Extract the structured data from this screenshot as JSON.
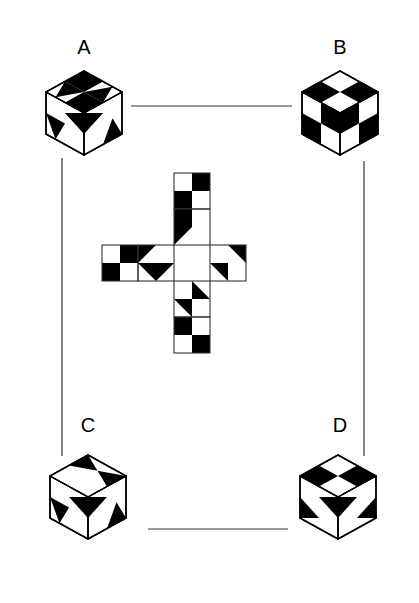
{
  "figure": {
    "title": "",
    "kind": "cube-net-matching-puzzle",
    "background_color": "#ffffff",
    "ink_color": "#000000",
    "line_color": "#333333"
  },
  "labels": {
    "a": "A",
    "b": "B",
    "c": "C",
    "d": "D"
  },
  "cubes": [
    {
      "id": "A",
      "label": "A",
      "label_x": 84,
      "label_y": 54,
      "center_x": 84,
      "center_y": 113,
      "faces": {
        "top": [
          "white-tri-black-right",
          "black",
          "black",
          "white-tri-black-left"
        ],
        "left": [
          "white",
          "black-tri-left",
          "black-tri-down",
          "white"
        ],
        "right": [
          "black-tri-right",
          "white",
          "white",
          "black-tri-up"
        ]
      }
    },
    {
      "id": "B",
      "label": "B",
      "label_x": 340,
      "label_y": 54,
      "center_x": 340,
      "center_y": 113,
      "faces": {
        "top": [
          "black",
          "white",
          "white",
          "black"
        ],
        "left": [
          "white",
          "black",
          "black",
          "white"
        ],
        "right": [
          "black",
          "white",
          "white",
          "black"
        ]
      }
    },
    {
      "id": "C",
      "label": "C",
      "label_x": 88,
      "label_y": 432,
      "center_x": 88,
      "center_y": 497,
      "faces": {
        "top": [
          "white",
          "black-tri-down",
          "white",
          "black-tri-up"
        ],
        "left": [
          "white",
          "black-tri-left",
          "black-tri-down",
          "white"
        ],
        "right": [
          "black-tri-right",
          "white",
          "white",
          "black-tri-up"
        ]
      }
    },
    {
      "id": "D",
      "label": "D",
      "label_x": 340,
      "label_y": 432,
      "center_x": 338,
      "center_y": 497,
      "faces": {
        "top": [
          "black",
          "white",
          "white",
          "black"
        ],
        "left": [
          "white",
          "black-tri-left",
          "black-tri-right",
          "white"
        ],
        "right": [
          "black-tri-right",
          "white",
          "white",
          "black-tri-left"
        ]
      }
    }
  ],
  "net": {
    "kind": "cross",
    "cell_size": 36,
    "origin_x": 102,
    "origin_y": 173,
    "squares": [
      {
        "name": "top",
        "col": 2,
        "row": 0,
        "quads": [
          "white",
          "black",
          "black",
          "white"
        ]
      },
      {
        "name": "upper-middle",
        "col": 2,
        "row": 1,
        "quads": [
          "black",
          "white",
          "tri-black-tl",
          "white"
        ]
      },
      {
        "name": "left",
        "col": 0,
        "row": 2,
        "quads": [
          "white",
          "black",
          "black",
          "white"
        ]
      },
      {
        "name": "center-left",
        "col": 1,
        "row": 2,
        "quads": [
          "tri-black-tl",
          "white",
          "tri-black-tr",
          "tri-black-tl"
        ]
      },
      {
        "name": "center-right",
        "col": 3,
        "row": 2,
        "quads": [
          "white",
          "tri-black-tr",
          "tri-black-tr",
          "white"
        ]
      },
      {
        "name": "lower-middle",
        "col": 2,
        "row": 3,
        "quads": [
          "white",
          "tri-black-bl",
          "tri-black-tr",
          "white"
        ]
      },
      {
        "name": "bottom",
        "col": 2,
        "row": 4,
        "quads": [
          "black",
          "white",
          "white",
          "black"
        ]
      }
    ]
  },
  "connectors": [
    {
      "name": "a-to-b",
      "from": "A",
      "to": "B",
      "orientation": "horizontal",
      "x1": 131,
      "y1": 106,
      "x2": 292,
      "y2": 106
    },
    {
      "name": "c-to-d",
      "from": "C",
      "to": "D",
      "orientation": "horizontal",
      "x1": 148,
      "y1": 529,
      "x2": 288,
      "y2": 529
    },
    {
      "name": "a-to-c",
      "from": "A",
      "to": "C",
      "orientation": "vertical",
      "x1": 62,
      "y1": 158,
      "x2": 62,
      "y2": 456
    },
    {
      "name": "b-to-d",
      "from": "B",
      "to": "D",
      "orientation": "vertical",
      "x1": 364,
      "y1": 161,
      "x2": 364,
      "y2": 456
    }
  ]
}
